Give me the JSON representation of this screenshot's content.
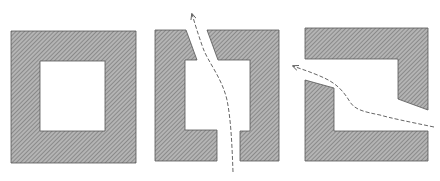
{
  "diagram": {
    "description": "Three hatched square frames: a closed frame, a frame with gaps top and bottom with a dashed path passing through vertically, and a frame with gaps on left and right sides with a dashed path passing through horizontally.",
    "colors": {
      "fill": "#a9a9a9",
      "hatch": "#6e6e6e",
      "outline": "#555555",
      "path": "#666666",
      "background": "#ffffff"
    },
    "shapes": [
      {
        "id": "closed-frame",
        "label": "Closed frame"
      },
      {
        "id": "vertical-gap-frame",
        "label": "Frame with top and bottom openings"
      },
      {
        "id": "horizontal-gap-frame",
        "label": "Frame with left and right openings"
      }
    ],
    "paths": [
      {
        "id": "vertical-path",
        "style": "dashed",
        "arrow": "up"
      },
      {
        "id": "horizontal-path",
        "style": "dashed",
        "arrow": "left"
      }
    ]
  }
}
